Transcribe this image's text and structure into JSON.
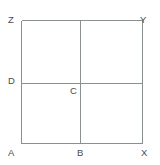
{
  "figure": {
    "type": "geometry-diagram",
    "background_color": "#ffffff",
    "stroke_color": "#8a8f8f",
    "label_color": "#4a4a4a",
    "stroke_width": 1,
    "square": {
      "left": 21,
      "top": 20,
      "right": 142,
      "bottom": 143
    },
    "vertical_divider_x": 80,
    "horizontal_divider_y": 83,
    "points": [
      {
        "id": "Z",
        "label": "Z",
        "role": "top-left-corner",
        "x": 21,
        "y": 20
      },
      {
        "id": "Y",
        "label": "Y",
        "role": "top-right-corner",
        "x": 142,
        "y": 20
      },
      {
        "id": "D",
        "label": "D",
        "role": "left-edge-midpoint",
        "x": 21,
        "y": 83
      },
      {
        "id": "C",
        "label": "C",
        "role": "interior-intersection",
        "x": 80,
        "y": 83
      },
      {
        "id": "A",
        "label": "A",
        "role": "bottom-left-corner",
        "x": 21,
        "y": 143
      },
      {
        "id": "B",
        "label": "B",
        "role": "bottom-edge-midpoint",
        "x": 80,
        "y": 143
      },
      {
        "id": "X",
        "label": "X",
        "role": "bottom-right-corner",
        "x": 142,
        "y": 143
      }
    ],
    "segments": [
      {
        "id": "top",
        "from": "Z",
        "to": "Y"
      },
      {
        "id": "left",
        "from": "Z",
        "to": "A"
      },
      {
        "id": "right",
        "from": "Y",
        "to": "X"
      },
      {
        "id": "bottom",
        "from": "A",
        "to": "X"
      },
      {
        "id": "vertical",
        "from": "top-midpoint",
        "to": "B"
      },
      {
        "id": "horizontal",
        "from": "D",
        "to": "right-edge"
      }
    ]
  }
}
